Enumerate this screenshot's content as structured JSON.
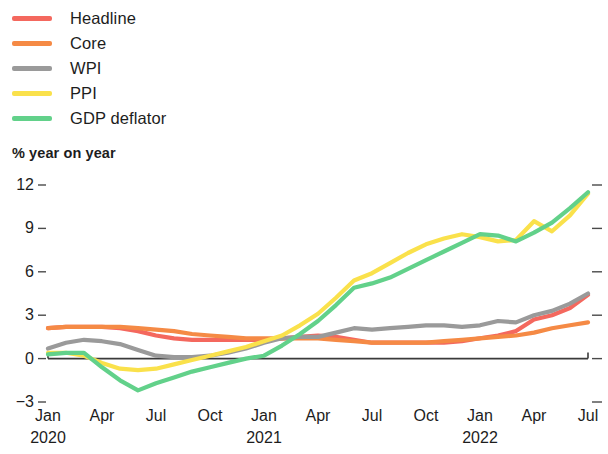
{
  "legend": {
    "items": [
      {
        "label": "Headline",
        "color": "#F4685E",
        "key": "headline"
      },
      {
        "label": "Core",
        "color": "#F58A45",
        "key": "core"
      },
      {
        "label": "WPI",
        "color": "#9A9A9A",
        "key": "wpi"
      },
      {
        "label": "PPI",
        "color": "#FAE14B",
        "key": "ppi"
      },
      {
        "label": "GDP deflator",
        "color": "#62D18A",
        "key": "gdp_deflator"
      }
    ]
  },
  "axis_title": "% year on year",
  "chart_data": {
    "type": "line",
    "title": "",
    "subtitle": "",
    "xlabel": "",
    "ylabel": "% year on year",
    "ylim": [
      -3,
      12
    ],
    "yticks": [
      12,
      9,
      6,
      3,
      0,
      -3
    ],
    "ytick_labels": [
      "12",
      "9",
      "6",
      "3",
      "0",
      "−3"
    ],
    "grid": false,
    "zero_line": true,
    "legend_position": "top-left",
    "x_tick_labels": [
      "Jan",
      "Apr",
      "Jul",
      "Oct",
      "Jan",
      "Apr",
      "Jul",
      "Oct",
      "Jan",
      "Apr",
      "Jul"
    ],
    "x_tick_years": [
      "2020",
      "",
      "",
      "",
      "2021",
      "",
      "",
      "",
      "2022",
      "",
      ""
    ],
    "x_tick_indices": [
      0,
      3,
      6,
      9,
      12,
      15,
      18,
      21,
      24,
      27,
      30
    ],
    "x": [
      "2020-01",
      "2020-02",
      "2020-03",
      "2020-04",
      "2020-05",
      "2020-06",
      "2020-07",
      "2020-08",
      "2020-09",
      "2020-10",
      "2020-11",
      "2020-12",
      "2021-01",
      "2021-02",
      "2021-03",
      "2021-04",
      "2021-05",
      "2021-06",
      "2021-07",
      "2021-08",
      "2021-09",
      "2021-10",
      "2021-11",
      "2021-12",
      "2022-01",
      "2022-02",
      "2022-03",
      "2022-04",
      "2022-05",
      "2022-06",
      "2022-07"
    ],
    "series": [
      {
        "name": "Headline",
        "color": "#F4685E",
        "values": [
          2.1,
          2.2,
          2.2,
          2.2,
          2.1,
          1.9,
          1.6,
          1.4,
          1.3,
          1.3,
          1.3,
          1.3,
          1.3,
          1.4,
          1.5,
          1.6,
          1.5,
          1.3,
          1.1,
          1.1,
          1.1,
          1.1,
          1.1,
          1.2,
          1.4,
          1.6,
          1.9,
          2.7,
          3.0,
          3.5,
          4.4
        ]
      },
      {
        "name": "Core",
        "color": "#F58A45",
        "values": [
          2.1,
          2.2,
          2.2,
          2.2,
          2.2,
          2.1,
          2.0,
          1.9,
          1.7,
          1.6,
          1.5,
          1.4,
          1.4,
          1.4,
          1.4,
          1.4,
          1.3,
          1.2,
          1.1,
          1.1,
          1.1,
          1.1,
          1.2,
          1.3,
          1.4,
          1.5,
          1.6,
          1.8,
          2.1,
          2.3,
          2.5
        ]
      },
      {
        "name": "WPI",
        "color": "#9A9A9A",
        "values": [
          0.7,
          1.1,
          1.3,
          1.2,
          1.0,
          0.6,
          0.2,
          0.1,
          0.1,
          0.2,
          0.4,
          0.7,
          1.1,
          1.4,
          1.5,
          1.5,
          1.8,
          2.1,
          2.0,
          2.1,
          2.2,
          2.3,
          2.3,
          2.2,
          2.3,
          2.6,
          2.5,
          3.0,
          3.3,
          3.8,
          4.5
        ]
      },
      {
        "name": "PPI",
        "color": "#FAE14B",
        "values": [
          0.4,
          0.4,
          0.2,
          -0.3,
          -0.7,
          -0.8,
          -0.7,
          -0.4,
          -0.1,
          0.2,
          0.5,
          0.8,
          1.2,
          1.6,
          2.3,
          3.1,
          4.2,
          5.4,
          5.9,
          6.6,
          7.3,
          7.9,
          8.3,
          8.6,
          8.4,
          8.1,
          8.2,
          9.5,
          8.8,
          9.9,
          11.4
        ]
      },
      {
        "name": "GDP deflator",
        "color": "#62D18A",
        "values": [
          0.3,
          0.4,
          0.4,
          -0.6,
          -1.5,
          -2.2,
          -1.7,
          -1.3,
          -0.9,
          -0.6,
          -0.3,
          0.0,
          0.2,
          0.9,
          1.7,
          2.6,
          3.7,
          4.9,
          5.2,
          5.6,
          6.2,
          6.8,
          7.4,
          8.0,
          8.6,
          8.5,
          8.1,
          8.7,
          9.4,
          10.4,
          11.5
        ]
      }
    ]
  }
}
